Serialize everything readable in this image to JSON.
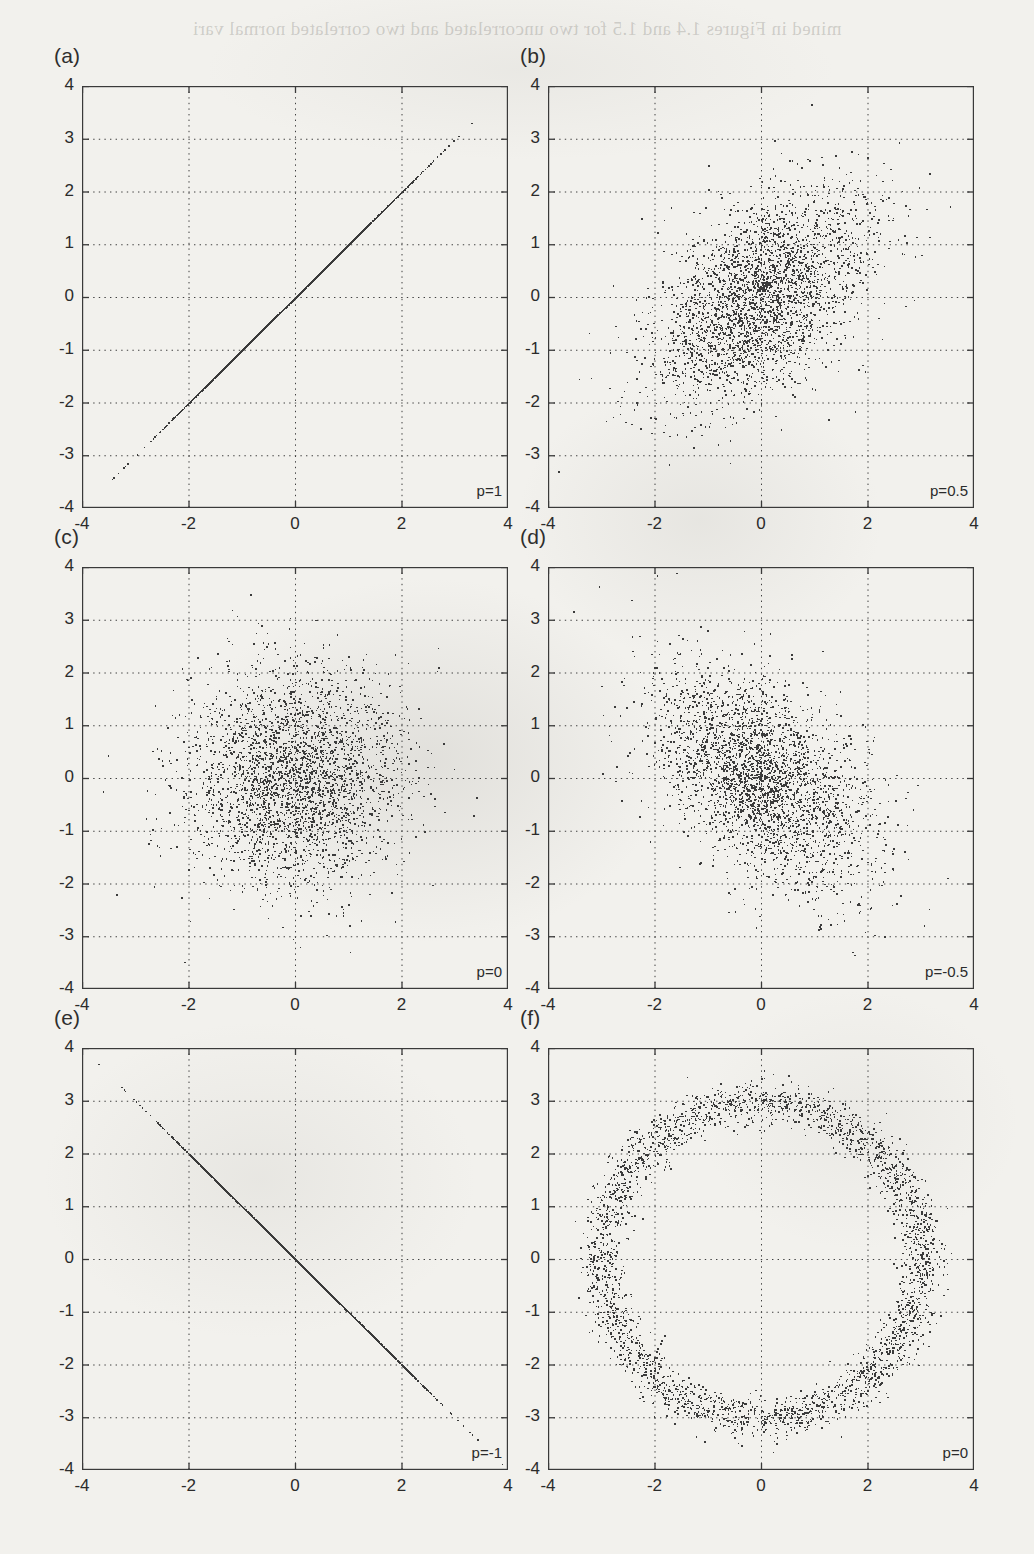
{
  "page": {
    "background_color": "#f2f1ed",
    "ink_color": "#3a3a3a",
    "bleed_through_text": "mined in Figures 1.4 and 1.5 for two uncorrelated and two correlated normal vari"
  },
  "figure": {
    "axis": {
      "x_min": -4,
      "x_max": 4,
      "y_min": -4,
      "y_max": 4,
      "x_ticks": [
        -4,
        -2,
        0,
        2,
        4
      ],
      "x_tick_labels": [
        "-4",
        "-2",
        "0",
        "2",
        "4"
      ],
      "y_ticks": [
        -4,
        -3,
        -2,
        -1,
        0,
        1,
        2,
        3,
        4
      ],
      "y_tick_labels": [
        "-4",
        "-3",
        "-2",
        "-1",
        "0",
        "1",
        "2",
        "3",
        "4"
      ],
      "grid": "dotted",
      "grid_x_values": [
        -2,
        0,
        2
      ],
      "grid_y_values": [
        -3,
        -2,
        -1,
        0,
        1,
        2,
        3
      ]
    },
    "panels": [
      {
        "key": "a",
        "label": "(a)",
        "annotation": "p=1",
        "row": 0,
        "col": 0
      },
      {
        "key": "b",
        "label": "(b)",
        "annotation": "p=0.5",
        "row": 0,
        "col": 1
      },
      {
        "key": "c",
        "label": "(c)",
        "annotation": "p=0",
        "row": 1,
        "col": 0
      },
      {
        "key": "d",
        "label": "(d)",
        "annotation": "p=-0.5",
        "row": 1,
        "col": 1
      },
      {
        "key": "e",
        "label": "(e)",
        "annotation": "p=-1",
        "row": 2,
        "col": 0
      },
      {
        "key": "f",
        "label": "(f)",
        "annotation": "p=0",
        "row": 2,
        "col": 1
      }
    ]
  },
  "chart_data": [
    {
      "type": "scatter",
      "panel": "a",
      "title": "(a)",
      "annotation": "p=1",
      "correlation": 1,
      "distribution": "bivariate normal, perfectly positively correlated",
      "n_points": 3000,
      "mean": [
        0,
        0
      ],
      "sigma": [
        1,
        1
      ],
      "xlabel": "",
      "ylabel": "",
      "xlim": [
        -4,
        4
      ],
      "ylim": [
        -4,
        4
      ],
      "xticks": [
        -4,
        -2,
        0,
        2,
        4
      ],
      "yticks": [
        -4,
        -3,
        -2,
        -1,
        0,
        1,
        2,
        3,
        4
      ],
      "grid": true,
      "observed_extent": {
        "x": [
          -2.95,
          3.75
        ],
        "y": [
          -2.95,
          3.75
        ]
      },
      "shape": "points lie exactly on the line y = x"
    },
    {
      "type": "scatter",
      "panel": "b",
      "title": "(b)",
      "annotation": "p=0.5",
      "correlation": 0.5,
      "distribution": "bivariate normal, moderate positive correlation",
      "n_points": 3000,
      "mean": [
        0,
        0
      ],
      "sigma": [
        1,
        1
      ],
      "xlabel": "",
      "ylabel": "",
      "xlim": [
        -4,
        4
      ],
      "ylim": [
        -4,
        4
      ],
      "xticks": [
        -4,
        -2,
        0,
        2,
        4
      ],
      "yticks": [
        -4,
        -3,
        -2,
        -1,
        0,
        1,
        2,
        3,
        4
      ],
      "grid": true,
      "observed_extent": {
        "x": [
          -3.2,
          3.0
        ],
        "y": [
          -3.6,
          3.5
        ]
      },
      "shape": "elliptical cloud tilted along y = x"
    },
    {
      "type": "scatter",
      "panel": "c",
      "title": "(c)",
      "annotation": "p=0",
      "correlation": 0,
      "distribution": "bivariate normal, independent components",
      "n_points": 3000,
      "mean": [
        0,
        0
      ],
      "sigma": [
        1,
        1
      ],
      "xlabel": "",
      "ylabel": "",
      "xlim": [
        -4,
        4
      ],
      "ylim": [
        -4,
        4
      ],
      "xticks": [
        -4,
        -2,
        0,
        2,
        4
      ],
      "yticks": [
        -4,
        -3,
        -2,
        -1,
        0,
        1,
        2,
        3,
        4
      ],
      "grid": true,
      "observed_extent": {
        "x": [
          -3.5,
          3.5
        ],
        "y": [
          -3.5,
          3.8
        ]
      },
      "shape": "isotropic circular cloud"
    },
    {
      "type": "scatter",
      "panel": "d",
      "title": "(d)",
      "annotation": "p=-0.5",
      "correlation": -0.5,
      "distribution": "bivariate normal, moderate negative correlation",
      "n_points": 3000,
      "mean": [
        0,
        0
      ],
      "sigma": [
        1,
        1
      ],
      "xlabel": "",
      "ylabel": "",
      "xlim": [
        -4,
        4
      ],
      "ylim": [
        -4,
        4
      ],
      "xticks": [
        -4,
        -2,
        0,
        2,
        4
      ],
      "yticks": [
        -4,
        -3,
        -2,
        -1,
        0,
        1,
        2,
        3,
        4
      ],
      "grid": true,
      "observed_extent": {
        "x": [
          -3.3,
          3.4
        ],
        "y": [
          -3.7,
          3.3
        ]
      },
      "shape": "elliptical cloud tilted along y = -x"
    },
    {
      "type": "scatter",
      "panel": "e",
      "title": "(e)",
      "annotation": "p=-1",
      "correlation": -1,
      "distribution": "bivariate normal, perfectly negatively correlated",
      "n_points": 3000,
      "mean": [
        0,
        0
      ],
      "sigma": [
        1,
        1
      ],
      "xlabel": "",
      "ylabel": "",
      "xlim": [
        -4,
        4
      ],
      "ylim": [
        -4,
        4
      ],
      "xticks": [
        -4,
        -2,
        0,
        2,
        4
      ],
      "yticks": [
        -4,
        -3,
        -2,
        -1,
        0,
        1,
        2,
        3,
        4
      ],
      "grid": true,
      "observed_extent": {
        "x": [
          -3.7,
          3.5
        ],
        "y": [
          -3.5,
          3.75
        ]
      },
      "shape": "points lie exactly on the line y = -x"
    },
    {
      "type": "scatter",
      "panel": "f",
      "title": "(f)",
      "annotation": "p=0",
      "correlation": 0,
      "distribution": "uniform on a noisy ring (uncorrelated but dependent)",
      "n_points": 3000,
      "mean": [
        0,
        0
      ],
      "ring_radius": 3,
      "ring_noise": 0.2,
      "xlabel": "",
      "ylabel": "",
      "xlim": [
        -4,
        4
      ],
      "ylim": [
        -4,
        4
      ],
      "xticks": [
        -4,
        -2,
        0,
        2,
        4
      ],
      "yticks": [
        -4,
        -3,
        -2,
        -1,
        0,
        1,
        2,
        3,
        4
      ],
      "grid": true,
      "observed_extent": {
        "x": [
          -3.2,
          3.2
        ],
        "y": [
          -3.2,
          3.2
        ]
      },
      "shape": "annulus centred at the origin with radius about 3"
    }
  ]
}
